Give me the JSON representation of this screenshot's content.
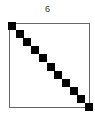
{
  "chart_data": {
    "type": "heatmap",
    "title": "6",
    "xlabel": "",
    "ylabel": "",
    "grid": false,
    "size": [
      11,
      11
    ],
    "nonzeros": [
      [
        0,
        0
      ],
      [
        1,
        1
      ],
      [
        2,
        2
      ],
      [
        3,
        3
      ],
      [
        4,
        4
      ],
      [
        5,
        5
      ],
      [
        6,
        6
      ],
      [
        7,
        7
      ],
      [
        8,
        8
      ],
      [
        9,
        9
      ],
      [
        10,
        10
      ]
    ],
    "marker_color": "#000000",
    "frame_color": "#666666"
  }
}
